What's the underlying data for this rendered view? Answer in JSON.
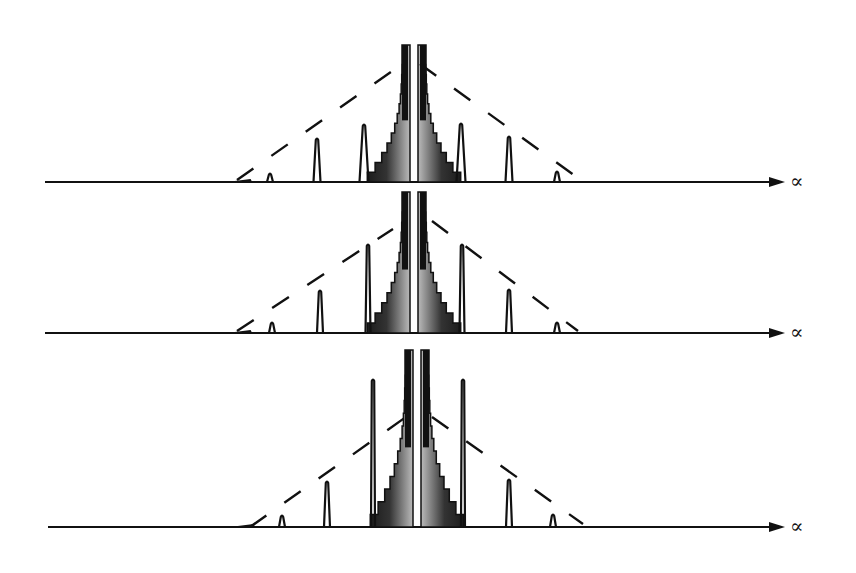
{
  "figure": {
    "width": 856,
    "height": 573,
    "ink_color": "#111111",
    "background": "#ffffff",
    "axis_label": "∝",
    "panels": [
      {
        "name": "panel-1",
        "baseline_y": 182,
        "axis_x_start": 45,
        "axis_x_end": 785,
        "label_x": 790,
        "center_left_x": 397,
        "center_right_x": 419,
        "center_gap": [
          410,
          418
        ],
        "center_top_y": 45,
        "center_base_half_width": 52,
        "peaks": [
          {
            "x": 270,
            "top_y": 172,
            "w": 6
          },
          {
            "x": 317,
            "top_y": 137,
            "w": 7
          },
          {
            "x": 364,
            "top_y": 123,
            "w": 9
          },
          {
            "x": 461,
            "top_y": 122,
            "w": 9
          },
          {
            "x": 509,
            "top_y": 135,
            "w": 7
          },
          {
            "x": 557,
            "top_y": 170,
            "w": 6
          }
        ],
        "envelope_left": [
          [
            237,
            180
          ],
          [
            405,
            62
          ]
        ],
        "envelope_right": [
          [
            420,
            64
          ],
          [
            578,
            178
          ]
        ]
      },
      {
        "name": "panel-2",
        "baseline_y": 333,
        "axis_x_start": 45,
        "axis_x_end": 785,
        "label_x": 790,
        "center_left_x": 397,
        "center_right_x": 421,
        "center_gap": [
          410,
          418
        ],
        "center_top_y": 192,
        "center_base_half_width": 52,
        "peaks": [
          {
            "x": 272,
            "top_y": 321,
            "w": 6
          },
          {
            "x": 320,
            "top_y": 289,
            "w": 6
          },
          {
            "x": 368,
            "top_y": 243,
            "w": 5
          },
          {
            "x": 462,
            "top_y": 243,
            "w": 5
          },
          {
            "x": 509,
            "top_y": 288,
            "w": 6
          },
          {
            "x": 557,
            "top_y": 321,
            "w": 6
          }
        ],
        "envelope_left": [
          [
            237,
            331
          ],
          [
            393,
            229
          ]
        ],
        "envelope_right": [
          [
            432,
            221
          ],
          [
            578,
            331
          ]
        ]
      },
      {
        "name": "panel-3",
        "baseline_y": 527,
        "axis_x_start": 48,
        "axis_x_end": 785,
        "label_x": 790,
        "center_left_x": 400,
        "center_right_x": 423,
        "center_gap": [
          413,
          421
        ],
        "center_top_y": 350,
        "center_base_half_width": 52,
        "peaks": [
          {
            "x": 282,
            "top_y": 514,
            "w": 6
          },
          {
            "x": 327,
            "top_y": 480,
            "w": 6
          },
          {
            "x": 373,
            "top_y": 378,
            "w": 4
          },
          {
            "x": 463,
            "top_y": 378,
            "w": 4
          },
          {
            "x": 509,
            "top_y": 478,
            "w": 6
          },
          {
            "x": 553,
            "top_y": 513,
            "w": 6
          }
        ],
        "envelope_left": [
          [
            250,
            527
          ],
          [
            413,
            412
          ]
        ],
        "envelope_right": [
          [
            432,
            417
          ],
          [
            583,
            524
          ]
        ]
      }
    ]
  }
}
